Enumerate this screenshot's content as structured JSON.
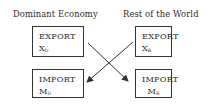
{
  "headings": {
    "left": "Dominant Economy",
    "right": "Rest of the World"
  },
  "boxes": {
    "dominant_export": {
      "label": "EXPORT",
      "var": "X",
      "sub": "D"
    },
    "dominant_import": {
      "label": "IMPORT",
      "var": "M",
      "sub": "D"
    },
    "rest_export": {
      "label": "EXPORT",
      "var": "X",
      "sub": "R"
    },
    "rest_import": {
      "label": "IMPORT",
      "var": "M",
      "sub": "R"
    }
  },
  "arrows": [
    {
      "from": "dominant_export",
      "to": "rest_import"
    },
    {
      "from": "rest_export",
      "to": "dominant_import"
    }
  ],
  "colors": {
    "line": "#333333",
    "text": "#2a2a2a",
    "background": "#ffffff"
  }
}
